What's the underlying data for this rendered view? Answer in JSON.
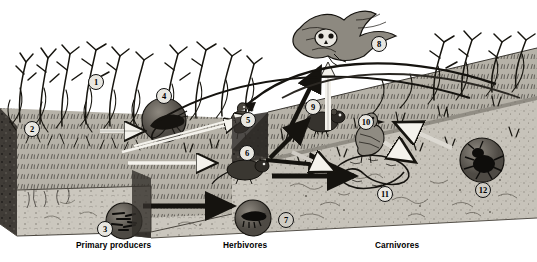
{
  "figure": {
    "type": "scientific-illustration",
    "style": "black-and-white halftone engraving",
    "palette": {
      "paper": "#ffffff",
      "ink": "#111111",
      "soil_top": "#b9b5ab",
      "soil_face": "#cfcbc2",
      "soil_dark_edge": "#3a3733",
      "inset_disk": "#6e6a62",
      "arrow_white": "#f2f0ea",
      "arrow_black": "#15130f"
    }
  },
  "trophic_labels": [
    {
      "id": "primary-producers",
      "text": "Primary producers",
      "x": 76,
      "y": 240
    },
    {
      "id": "herbivores",
      "text": "Herbivores",
      "x": 223,
      "y": 240
    },
    {
      "id": "carnivores",
      "text": "Carnivores",
      "x": 375,
      "y": 240
    }
  ],
  "markers": [
    {
      "n": "1",
      "x": 88,
      "y": 74,
      "subject": "grass shoots / standing vegetation",
      "dark": false
    },
    {
      "n": "2",
      "x": 24,
      "y": 121,
      "subject": "plant roots in soil",
      "dark": false
    },
    {
      "n": "3",
      "x": 97,
      "y": 221,
      "subject": "soil bacteria and detritus",
      "dark": false
    },
    {
      "n": "4",
      "x": 156,
      "y": 88,
      "subject": "grasshopper",
      "dark": false
    },
    {
      "n": "5",
      "x": 240,
      "y": 112,
      "subject": "seed-eating bird",
      "dark": false
    },
    {
      "n": "6",
      "x": 239,
      "y": 145,
      "subject": "vole / field mouse",
      "dark": false
    },
    {
      "n": "7",
      "x": 278,
      "y": 212,
      "subject": "soil arthropod larva",
      "dark": true
    },
    {
      "n": "8",
      "x": 371,
      "y": 36,
      "subject": "owl in flight",
      "dark": false
    },
    {
      "n": "9",
      "x": 305,
      "y": 99,
      "subject": "shrew",
      "dark": false
    },
    {
      "n": "10",
      "x": 358,
      "y": 114,
      "subject": "insectivorous bird",
      "dark": false
    },
    {
      "n": "11",
      "x": 377,
      "y": 186,
      "subject": "snake",
      "dark": false
    },
    {
      "n": "12",
      "x": 475,
      "y": 182,
      "subject": "predatory beetle",
      "dark": true
    }
  ],
  "insets": [
    {
      "id": "inset-grasshopper",
      "marker": "4",
      "cx": 164,
      "cy": 120,
      "r": 22,
      "subject": "grasshopper close-up"
    },
    {
      "id": "inset-bacteria",
      "marker": "3",
      "cx": 124,
      "cy": 221,
      "r": 18,
      "subject": "decomposer bacteria close-up"
    },
    {
      "id": "inset-larva",
      "marker": "7",
      "cx": 253,
      "cy": 218,
      "r": 18,
      "subject": "soil larva close-up"
    },
    {
      "id": "inset-beetle",
      "marker": "12",
      "cx": 482,
      "cy": 160,
      "r": 22,
      "subject": "predatory beetle close-up"
    }
  ],
  "blocks": [
    {
      "id": "block-producers",
      "label": "Primary producers",
      "subject": "grassland turf block with roots and soil profile"
    },
    {
      "id": "block-herbivores",
      "label": "Herbivores",
      "subject": "soil block showing herbivore feeding layer"
    },
    {
      "id": "block-carnivores",
      "label": "Carnivores",
      "subject": "soil block showing carnivore layer"
    }
  ],
  "flow_arrows": [
    {
      "id": "arrow-producers-to-grasshopper",
      "color": "white",
      "from": "grass",
      "to": "grasshopper"
    },
    {
      "id": "arrow-producers-to-vole",
      "color": "white",
      "from": "grass",
      "to": "vole"
    },
    {
      "id": "arrow-producers-to-bird",
      "color": "white",
      "from": "grass",
      "to": "seed-eating bird"
    },
    {
      "id": "arrow-detritus-chain",
      "color": "black",
      "from": "primary producers block",
      "to": "herbivores block"
    },
    {
      "id": "arrow-herbivore-chain",
      "color": "black",
      "from": "herbivores block",
      "to": "carnivores block"
    },
    {
      "id": "arrow-herbivores-to-snake",
      "color": "black",
      "from": "herbivores",
      "to": "snake"
    },
    {
      "id": "arrow-to-owl-up",
      "color": "white",
      "from": "herbivore layer",
      "to": "owl"
    },
    {
      "id": "arrow-to-owl-diagonal",
      "color": "black",
      "from": "carnivore layer",
      "to": "owl"
    },
    {
      "id": "arrow-beetle-return",
      "color": "white",
      "from": "beetle",
      "to": "soil"
    },
    {
      "id": "arc-energy-return",
      "color": "black",
      "from": "carnivores",
      "to": "producers"
    }
  ]
}
